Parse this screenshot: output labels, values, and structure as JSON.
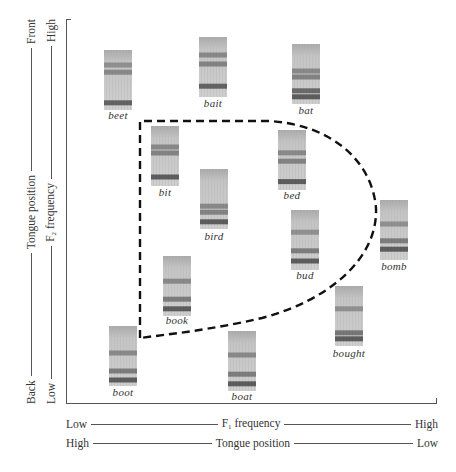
{
  "figure": {
    "x_axis": {
      "f1_row": {
        "left": "Low",
        "center_main": "F",
        "center_sub": "1",
        "center_rest": " frequency",
        "right": "High"
      },
      "tongue_row": {
        "left": "High",
        "center": "Tongue position",
        "right": "Low"
      }
    },
    "y_axis": {
      "tongue_col": {
        "bottom": "Back",
        "center": "Tongue position",
        "top": "Front"
      },
      "f2_col": {
        "bottom": "Low",
        "center_main": "F",
        "center_sub": "2",
        "center_rest": " frequency",
        "top": "High"
      }
    },
    "vowels": [
      {
        "word": "beet",
        "x": 104,
        "y": 50,
        "label_y": 109
      },
      {
        "word": "bait",
        "x": 199,
        "y": 37,
        "label_y": 97
      },
      {
        "word": "bat",
        "x": 292,
        "y": 44,
        "label_y": 104
      },
      {
        "word": "bit",
        "x": 151,
        "y": 126,
        "label_y": 186
      },
      {
        "word": "bed",
        "x": 278,
        "y": 130,
        "label_y": 189
      },
      {
        "word": "bird",
        "x": 200,
        "y": 169,
        "label_y": 230
      },
      {
        "word": "bud",
        "x": 291,
        "y": 210,
        "label_y": 269
      },
      {
        "word": "bomb",
        "x": 380,
        "y": 200,
        "label_y": 260
      },
      {
        "word": "book",
        "x": 163,
        "y": 256,
        "label_y": 314
      },
      {
        "word": "bought",
        "x": 335,
        "y": 286,
        "label_y": 347
      },
      {
        "word": "boot",
        "x": 109,
        "y": 326,
        "label_y": 386
      },
      {
        "word": "boat",
        "x": 228,
        "y": 331,
        "label_y": 390
      }
    ],
    "colors": {
      "axis": "#555555",
      "dashed_boundary": "#111111",
      "spectrogram_light": "#c8c8c8",
      "spectrogram_dark": "#3a3a3a"
    }
  }
}
